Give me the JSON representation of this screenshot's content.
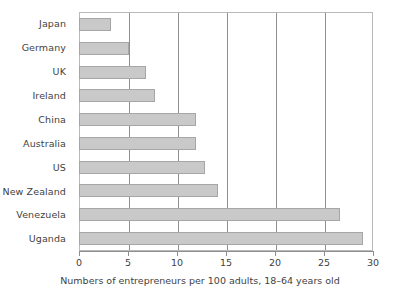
{
  "chart_data": {
    "type": "bar",
    "orientation": "horizontal",
    "title": "",
    "xlabel": "Numbers of entrepreneurs per 100 adults, 18–64 years old",
    "ylabel": "",
    "categories": [
      "Japan",
      "Germany",
      "UK",
      "Ireland",
      "China",
      "Australia",
      "US",
      "New Zealand",
      "Venezuela",
      "Uganda"
    ],
    "values": [
      3.2,
      5.0,
      6.7,
      7.7,
      11.8,
      11.8,
      12.8,
      14.1,
      26.5,
      28.9
    ],
    "series": [
      {
        "name": "Entrepreneurs per 100 adults",
        "values": [
          3.2,
          5.0,
          6.7,
          7.7,
          11.8,
          11.8,
          12.8,
          14.1,
          26.5,
          28.9
        ]
      }
    ],
    "xlim": [
      0,
      30
    ],
    "xticks": [
      0,
      5,
      10,
      15,
      20,
      25,
      30
    ],
    "xtick_labels": [
      "0",
      "5",
      "10",
      "15",
      "20",
      "25",
      "30"
    ],
    "gridlines_x": [
      5,
      10,
      15,
      20,
      25
    ],
    "grid": true,
    "grid_axis": "x",
    "legend": false,
    "legend_position": "none",
    "bar_color": "#c9c9c9",
    "bar_border_color": "#a6a6a6",
    "frame_color": "#b9b9b9",
    "grid_color": "#8e8e8e",
    "text_color": "#3f3f3f",
    "background": "#ffffff"
  }
}
